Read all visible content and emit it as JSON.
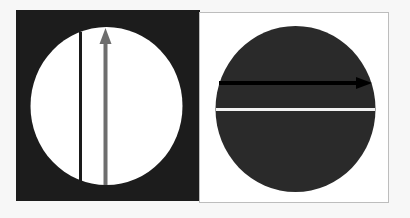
{
  "figure": {
    "panels": [
      {
        "id": "left",
        "description": "Dark square with white circle; black vertical line and gray upward arrow",
        "background_color": "#1c1c1c",
        "circle_color": "#ffffff",
        "line_color": "#1a1a1a",
        "arrow_color": "#6e6e6e",
        "line_label": "black-vertical-line",
        "arrow_label": "gray-up-arrow"
      },
      {
        "id": "right",
        "description": "White square with dark circle; black rightward arrow and white horizontal line",
        "background_color": "#ffffff",
        "border_color": "#bdbdbd",
        "circle_color": "#2a2a2a",
        "arrow_color": "#000000",
        "line_color": "#f2f2f2",
        "arrow_label": "black-right-arrow",
        "line_label": "white-horizontal-line"
      }
    ]
  }
}
